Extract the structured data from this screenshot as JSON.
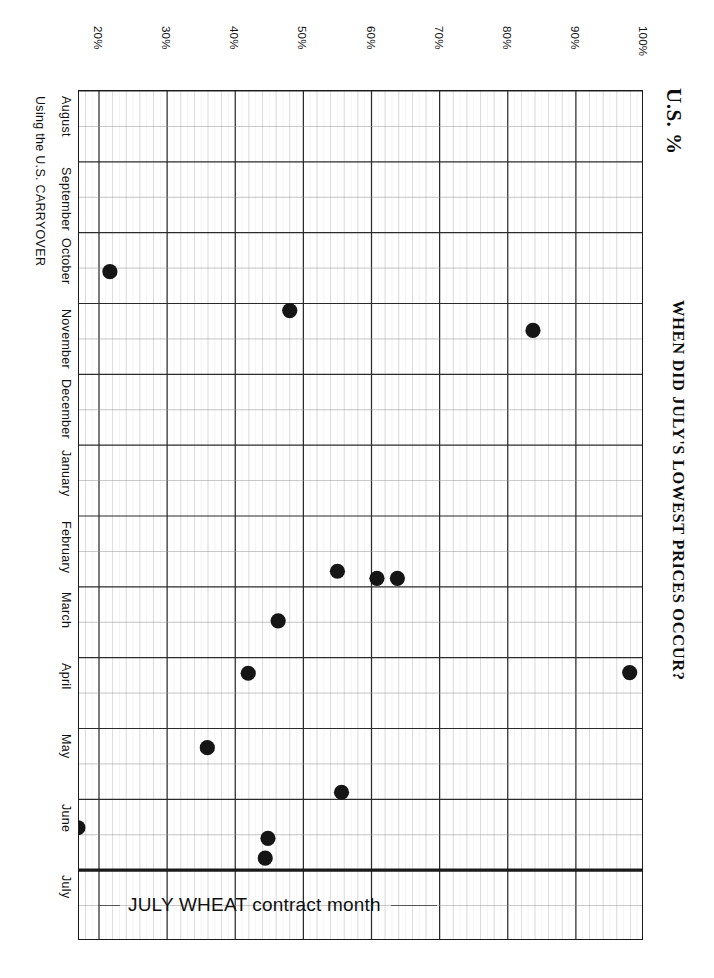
{
  "titles": {
    "unit": "U.S. %",
    "main": "WHEN DID JULY'S LOWEST PRICES OCCUR?",
    "subtitle": "Using the U.S. CARRYOVER",
    "credit": "Wm. Grandmill (1985) Ltd."
  },
  "annotation": {
    "text": "JULY WHEAT contract month"
  },
  "axis": {
    "x_ticks": [
      "20%",
      "30%",
      "40%",
      "50%",
      "60%",
      "70%",
      "80%",
      "90%",
      "100%"
    ],
    "y_months": [
      "August",
      "September",
      "October",
      "November",
      "December",
      "January",
      "February",
      "March",
      "April",
      "May",
      "June",
      "July"
    ]
  },
  "colors": {
    "ink": "#151515",
    "grid_major": "#2b2b2b",
    "grid_minor": "#8e8e8e",
    "paper": "#ffffff"
  },
  "chart_data": {
    "type": "scatter",
    "title": "WHEN DID JULY'S LOWEST PRICES OCCUR?",
    "subtitle": "Using the U.S. CARRYOVER",
    "xlabel": "U.S. %",
    "ylabel": "JULY WHEAT contract month",
    "xlim": [
      15,
      103
    ],
    "ylim_months": [
      "August",
      "July"
    ],
    "grid": true,
    "legend": "none",
    "x_ticks": [
      20,
      30,
      40,
      50,
      60,
      70,
      80,
      90,
      100
    ],
    "y_categories": [
      "August",
      "September",
      "October",
      "November",
      "December",
      "January",
      "February",
      "March",
      "April",
      "May",
      "June",
      "July"
    ],
    "points": [
      {
        "us_percent": 21.6,
        "month": "October",
        "month_frac": 0.55,
        "label": "October, 21.6%"
      },
      {
        "us_percent": 48.0,
        "month": "November",
        "month_frac": 0.1,
        "label": "November, 48%"
      },
      {
        "us_percent": 83.7,
        "month": "November",
        "month_frac": 0.38,
        "label": "November, 83.7%"
      },
      {
        "us_percent": 55.0,
        "month": "February",
        "month_frac": 0.78,
        "label": "February, 55%"
      },
      {
        "us_percent": 60.8,
        "month": "February",
        "month_frac": 0.88,
        "label": "February, 60.8%"
      },
      {
        "us_percent": 63.8,
        "month": "February",
        "month_frac": 0.88,
        "label": "February, 63.8%"
      },
      {
        "us_percent": 46.3,
        "month": "March",
        "month_frac": 0.48,
        "label": "March, 46.3%"
      },
      {
        "us_percent": 41.9,
        "month": "April",
        "month_frac": 0.22,
        "label": "April, 41.9%"
      },
      {
        "us_percent": 97.9,
        "month": "April",
        "month_frac": 0.21,
        "label": "April, 97.9%"
      },
      {
        "us_percent": 35.9,
        "month": "May",
        "month_frac": 0.27,
        "label": "May, 35.9%"
      },
      {
        "us_percent": 55.6,
        "month": "May",
        "month_frac": 0.9,
        "label": "May, 55.6%"
      },
      {
        "us_percent": 16.9,
        "month": "June",
        "month_frac": 0.4,
        "label": "June, 16.9%"
      },
      {
        "us_percent": 44.8,
        "month": "June",
        "month_frac": 0.55,
        "label": "June, 44.8%"
      },
      {
        "us_percent": 44.4,
        "month": "June",
        "month_frac": 0.83,
        "label": "June, 44.4%"
      }
    ]
  }
}
